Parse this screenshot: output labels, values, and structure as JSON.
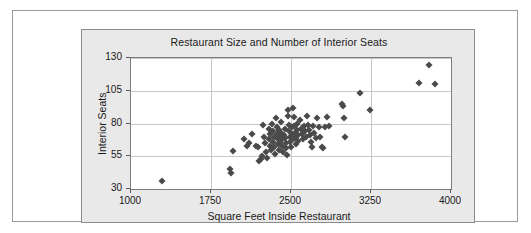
{
  "figure": {
    "background_color": "#ffffff",
    "panel_color": "#e9e9e9",
    "plot_background_color": "#ffffff",
    "border_color": "#8c8c8c",
    "gridline_color": "#c8c8c8",
    "marker_color": "#4a4a4a",
    "marker_shape": "diamond"
  },
  "chart_data": {
    "type": "scatter",
    "title": "Restaurant Size and Number of Interior Seats",
    "xlabel": "Square Feet Inside Restaurant",
    "ylabel": "Interior Seats",
    "xlim": [
      1000,
      4000
    ],
    "ylim": [
      30,
      130
    ],
    "xticks": [
      1000,
      1750,
      2500,
      3250,
      4000
    ],
    "yticks": [
      30,
      55,
      80,
      105,
      130
    ],
    "xtick_labels": [
      "1000",
      "1750",
      "2500",
      "3250",
      "4000"
    ],
    "ytick_labels": [
      "30",
      "55",
      "80",
      "105",
      "130"
    ],
    "grid": "horizontal-and-vertical",
    "legend": "none",
    "n_points": 104,
    "points": [
      [
        1290,
        36
      ],
      [
        1930,
        45
      ],
      [
        1940,
        42
      ],
      [
        1960,
        59
      ],
      [
        2060,
        68
      ],
      [
        2090,
        63
      ],
      [
        2110,
        65
      ],
      [
        2130,
        72
      ],
      [
        2170,
        63
      ],
      [
        2190,
        62
      ],
      [
        2200,
        51
      ],
      [
        2215,
        53
      ],
      [
        2230,
        55
      ],
      [
        2240,
        79
      ],
      [
        2250,
        70
      ],
      [
        2260,
        65
      ],
      [
        2270,
        58
      ],
      [
        2275,
        54
      ],
      [
        2290,
        76
      ],
      [
        2295,
        68
      ],
      [
        2300,
        63
      ],
      [
        2305,
        72
      ],
      [
        2310,
        60
      ],
      [
        2320,
        80
      ],
      [
        2330,
        74
      ],
      [
        2335,
        66
      ],
      [
        2340,
        70
      ],
      [
        2345,
        62
      ],
      [
        2350,
        57
      ],
      [
        2360,
        84
      ],
      [
        2365,
        77
      ],
      [
        2370,
        72
      ],
      [
        2375,
        68
      ],
      [
        2380,
        64
      ],
      [
        2385,
        60
      ],
      [
        2390,
        75
      ],
      [
        2395,
        70
      ],
      [
        2400,
        66
      ],
      [
        2405,
        81
      ],
      [
        2410,
        73
      ],
      [
        2415,
        68
      ],
      [
        2420,
        63
      ],
      [
        2425,
        58
      ],
      [
        2430,
        71
      ],
      [
        2440,
        76
      ],
      [
        2445,
        69
      ],
      [
        2450,
        65
      ],
      [
        2455,
        61
      ],
      [
        2460,
        56
      ],
      [
        2470,
        90
      ],
      [
        2475,
        86
      ],
      [
        2480,
        79
      ],
      [
        2485,
        74
      ],
      [
        2490,
        70
      ],
      [
        2495,
        66
      ],
      [
        2500,
        62
      ],
      [
        2505,
        77
      ],
      [
        2510,
        72
      ],
      [
        2515,
        68
      ],
      [
        2520,
        92
      ],
      [
        2525,
        85
      ],
      [
        2530,
        78
      ],
      [
        2535,
        73
      ],
      [
        2540,
        69
      ],
      [
        2545,
        64
      ],
      [
        2555,
        80
      ],
      [
        2560,
        75
      ],
      [
        2565,
        71
      ],
      [
        2570,
        67
      ],
      [
        2580,
        83
      ],
      [
        2590,
        76
      ],
      [
        2600,
        72
      ],
      [
        2610,
        68
      ],
      [
        2620,
        78
      ],
      [
        2630,
        74
      ],
      [
        2640,
        70
      ],
      [
        2650,
        86
      ],
      [
        2660,
        79
      ],
      [
        2670,
        75
      ],
      [
        2680,
        71
      ],
      [
        2690,
        66
      ],
      [
        2700,
        62
      ],
      [
        2710,
        78
      ],
      [
        2720,
        73
      ],
      [
        2730,
        69
      ],
      [
        2745,
        84
      ],
      [
        2760,
        77
      ],
      [
        2775,
        70
      ],
      [
        2790,
        62
      ],
      [
        2800,
        61
      ],
      [
        2820,
        77
      ],
      [
        2840,
        85
      ],
      [
        2860,
        78
      ],
      [
        2980,
        95
      ],
      [
        2990,
        93
      ],
      [
        3000,
        84
      ],
      [
        3010,
        70
      ],
      [
        3150,
        103
      ],
      [
        3240,
        90
      ],
      [
        3700,
        111
      ],
      [
        3790,
        125
      ],
      [
        3850,
        110
      ]
    ]
  },
  "axes": {
    "y_tick_positions": [
      130,
      105,
      80,
      55,
      30
    ],
    "x_tick_positions": [
      1000,
      1750,
      2500,
      3250,
      4000
    ]
  }
}
